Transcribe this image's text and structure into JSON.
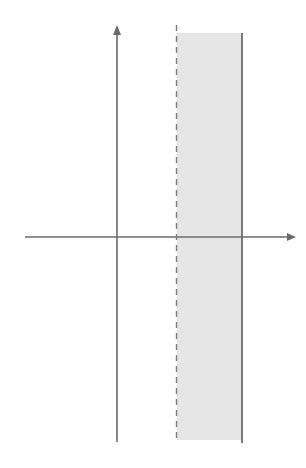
{
  "diagram": {
    "type": "coordinate-plane-vertical-strip",
    "colors": {
      "axis": "#6b6b6b",
      "shading": "#e6e6e6",
      "dashed_line": "#7a7a7a",
      "solid_line": "#6b6b6b"
    },
    "x_axis": {
      "x1": 25,
      "x2": 296,
      "y": 237
    },
    "y_axis": {
      "x": 117,
      "y1": 25,
      "y2": 442
    },
    "dashed_boundary": {
      "x": 176,
      "y1": 25,
      "y2": 442
    },
    "solid_boundary": {
      "x": 242,
      "y1": 33,
      "y2": 443
    },
    "shaded_region": {
      "x1": 176,
      "x2": 242,
      "y1": 33,
      "y2": 440
    }
  }
}
